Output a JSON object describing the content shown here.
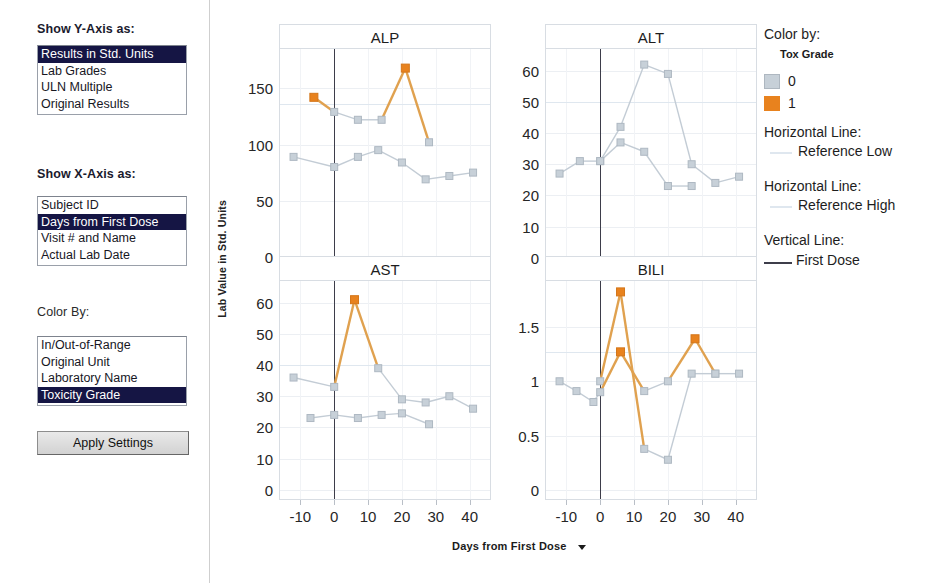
{
  "controls": {
    "y_axis_label": "Show Y-Axis as:",
    "y_axis_options": [
      "Results in Std. Units",
      "Lab Grades",
      "ULN Multiple",
      "Original Results"
    ],
    "y_axis_selected": "Results in Std. Units",
    "x_axis_label": "Show X-Axis as:",
    "x_axis_options": [
      "Subject ID",
      "Days from First Dose",
      "Visit # and Name",
      "Actual Lab Date"
    ],
    "x_axis_selected": "Days from First Dose",
    "color_by_label": "Color By:",
    "color_by_options": [
      "In/Out-of-Range",
      "Original Unit",
      "Laboratory Name",
      "Toxicity Grade"
    ],
    "color_by_selected": "Toxicity Grade",
    "apply_button": "Apply Settings"
  },
  "legend": {
    "color_by_title": "Color by:",
    "color_by_variable": "Tox Grade",
    "grades": [
      {
        "label": "0",
        "color": "#c7d0d8"
      },
      {
        "label": "1",
        "color": "#e8821e"
      }
    ],
    "hline_low_title": "Horizontal Line:",
    "hline_low_label": "Reference Low",
    "hline_low_color": "#dfe7ef",
    "hline_high_title": "Horizontal Line:",
    "hline_high_label": "Reference High",
    "hline_high_color": "#dfe7ef",
    "vline_title": "Vertical Line:",
    "vline_label": "First Dose",
    "vline_color": "#3d3d4a"
  },
  "axes": {
    "y_title": "Lab Value in Std. Units",
    "x_title": "Days from First Dose",
    "x_title_dropdown_icon": "chevron-down-icon",
    "x_ticks": [
      -10,
      0,
      10,
      20,
      30,
      40
    ],
    "x_range": [
      -16,
      46
    ]
  },
  "chart_data": [
    {
      "type": "line",
      "title": "ALP",
      "xlabel": "Days from First Dose",
      "ylabel": "Lab Value in Std. Units",
      "ylim": [
        -9,
        185
      ],
      "yticks": [
        0,
        50,
        100,
        150
      ],
      "xlim": [
        -16,
        46
      ],
      "xticks": [
        -10,
        0,
        10,
        20,
        30,
        40
      ],
      "grid": true,
      "reference_lines": [
        {
          "label": "Reference High",
          "y": 136
        }
      ],
      "vertical_line": {
        "label": "First Dose",
        "x": 0
      },
      "series": [
        {
          "name": "subject-upper",
          "points": [
            {
              "x": -6,
              "y": 142,
              "grade": "1"
            },
            {
              "x": 0,
              "y": 129,
              "grade": "0"
            },
            {
              "x": 7,
              "y": 122,
              "grade": "0"
            },
            {
              "x": 14,
              "y": 122,
              "grade": "0"
            },
            {
              "x": 21,
              "y": 168,
              "grade": "1"
            },
            {
              "x": 28,
              "y": 102,
              "grade": "0"
            }
          ]
        },
        {
          "name": "subject-lower",
          "points": [
            {
              "x": -12,
              "y": 89,
              "grade": "0"
            },
            {
              "x": 0,
              "y": 80,
              "grade": "0"
            },
            {
              "x": 7,
              "y": 89,
              "grade": "0"
            },
            {
              "x": 13,
              "y": 95,
              "grade": "0"
            },
            {
              "x": 20,
              "y": 84,
              "grade": "0"
            },
            {
              "x": 27,
              "y": 69,
              "grade": "0"
            },
            {
              "x": 34,
              "y": 72,
              "grade": "0"
            },
            {
              "x": 41,
              "y": 75,
              "grade": "0"
            }
          ]
        }
      ]
    },
    {
      "type": "line",
      "title": "ALT",
      "xlabel": "Days from First Dose",
      "ylabel": "Lab Value in Std. Units",
      "ylim": [
        -3,
        67
      ],
      "yticks": [
        0,
        10,
        20,
        30,
        40,
        50,
        60
      ],
      "xlim": [
        -16,
        46
      ],
      "xticks": [
        -10,
        0,
        10,
        20,
        30,
        40
      ],
      "grid": true,
      "reference_lines": [
        {
          "label": "Reference High",
          "y": 50
        }
      ],
      "vertical_line": {
        "label": "First Dose",
        "x": 0
      },
      "series": [
        {
          "name": "subject-peak",
          "points": [
            {
              "x": -12,
              "y": 27,
              "grade": "0"
            },
            {
              "x": -6,
              "y": 31,
              "grade": "0"
            },
            {
              "x": 0,
              "y": 31,
              "grade": "0"
            },
            {
              "x": 6,
              "y": 42,
              "grade": "0"
            },
            {
              "x": 13,
              "y": 62,
              "grade": "0"
            },
            {
              "x": 20,
              "y": 59,
              "grade": "0"
            },
            {
              "x": 27,
              "y": 30,
              "grade": "0"
            },
            {
              "x": 34,
              "y": 24,
              "grade": "0"
            },
            {
              "x": 41,
              "y": 26,
              "grade": "0"
            }
          ]
        },
        {
          "name": "subject-flat",
          "points": [
            {
              "x": 0,
              "y": 31,
              "grade": "0"
            },
            {
              "x": 6,
              "y": 37,
              "grade": "0"
            },
            {
              "x": 13,
              "y": 34,
              "grade": "0"
            },
            {
              "x": 20,
              "y": 23,
              "grade": "0"
            },
            {
              "x": 27,
              "y": 23,
              "grade": "0"
            }
          ]
        }
      ]
    },
    {
      "type": "line",
      "title": "AST",
      "xlabel": "Days from First Dose",
      "ylabel": "Lab Value in Std. Units",
      "ylim": [
        -3,
        67
      ],
      "yticks": [
        0,
        10,
        20,
        30,
        40,
        50,
        60
      ],
      "xlim": [
        -16,
        46
      ],
      "xticks": [
        -10,
        0,
        10,
        20,
        30,
        40
      ],
      "grid": true,
      "reference_lines": [
        {
          "label": "Reference High",
          "y": 40
        }
      ],
      "vertical_line": {
        "label": "First Dose",
        "x": 0
      },
      "series": [
        {
          "name": "subject-peak",
          "points": [
            {
              "x": -12,
              "y": 36,
              "grade": "0"
            },
            {
              "x": 0,
              "y": 33,
              "grade": "0"
            },
            {
              "x": 6,
              "y": 61,
              "grade": "1"
            },
            {
              "x": 13,
              "y": 39,
              "grade": "0"
            },
            {
              "x": 20,
              "y": 29,
              "grade": "0"
            },
            {
              "x": 27,
              "y": 28,
              "grade": "0"
            },
            {
              "x": 34,
              "y": 30,
              "grade": "0"
            },
            {
              "x": 41,
              "y": 26,
              "grade": "0"
            }
          ]
        },
        {
          "name": "subject-flat",
          "points": [
            {
              "x": -7,
              "y": 23,
              "grade": "0"
            },
            {
              "x": 0,
              "y": 24,
              "grade": "0"
            },
            {
              "x": 7,
              "y": 23,
              "grade": "0"
            },
            {
              "x": 14,
              "y": 24,
              "grade": "0"
            },
            {
              "x": 20,
              "y": 24.5,
              "grade": "0"
            },
            {
              "x": 28,
              "y": 21,
              "grade": "0"
            }
          ]
        }
      ]
    },
    {
      "type": "line",
      "title": "BILI",
      "xlabel": "Days from First Dose",
      "ylabel": "Lab Value in Std. Units",
      "ylim": [
        -0.08,
        1.92
      ],
      "yticks": [
        0,
        0.5,
        1,
        1.5
      ],
      "xlim": [
        -16,
        46
      ],
      "xticks": [
        -10,
        0,
        10,
        20,
        30,
        40
      ],
      "grid": true,
      "reference_lines": [
        {
          "label": "Reference High",
          "y": 1.27
        }
      ],
      "vertical_line": {
        "label": "First Dose",
        "x": 0
      },
      "series": [
        {
          "name": "subject-spike",
          "points": [
            {
              "x": 0,
              "y": 1.0,
              "grade": "0"
            },
            {
              "x": 6,
              "y": 1.82,
              "grade": "1"
            },
            {
              "x": 13,
              "y": 0.38,
              "grade": "0"
            },
            {
              "x": 20,
              "y": 0.28,
              "grade": "0"
            },
            {
              "x": 27,
              "y": 1.07,
              "grade": "0"
            },
            {
              "x": 34,
              "y": 1.07,
              "grade": "0"
            },
            {
              "x": 41,
              "y": 1.07,
              "grade": "0"
            }
          ]
        },
        {
          "name": "subject-second",
          "points": [
            {
              "x": -12,
              "y": 1.0,
              "grade": "0"
            },
            {
              "x": -7,
              "y": 0.91,
              "grade": "0"
            },
            {
              "x": -2,
              "y": 0.81,
              "grade": "0"
            },
            {
              "x": 0,
              "y": 0.9,
              "grade": "0"
            },
            {
              "x": 6,
              "y": 1.27,
              "grade": "1"
            },
            {
              "x": 13,
              "y": 0.91,
              "grade": "0"
            },
            {
              "x": 20,
              "y": 1.0,
              "grade": "0"
            },
            {
              "x": 28,
              "y": 1.39,
              "grade": "1"
            },
            {
              "x": 34,
              "y": 1.07,
              "grade": "0"
            }
          ]
        }
      ]
    }
  ]
}
